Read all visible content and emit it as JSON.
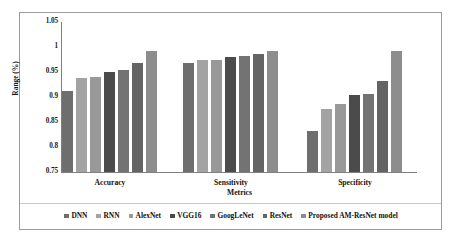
{
  "chart_data": {
    "type": "bar",
    "title": "",
    "xlabel": "Metrics",
    "ylabel": "Range (%)",
    "categories": [
      "Accuracy",
      "Sensitivity",
      "Specificity"
    ],
    "ylim": [
      0.75,
      1.05
    ],
    "yticks": [
      "1.05",
      "1",
      "0.95",
      "0.9",
      "0.85",
      "0.8",
      "0.75"
    ],
    "ytick_values": [
      1.05,
      1.0,
      0.95,
      0.9,
      0.85,
      0.8,
      0.75
    ],
    "grid": false,
    "legend_position": "bottom",
    "series": [
      {
        "name": "DNN",
        "color": "#6e6e6e",
        "values": [
          0.912,
          0.968,
          0.832
        ]
      },
      {
        "name": "RNN",
        "color": "#a3a3a3",
        "values": [
          0.939,
          0.974,
          0.877
        ]
      },
      {
        "name": "AlexNet",
        "color": "#999999",
        "values": [
          0.941,
          0.974,
          0.886
        ]
      },
      {
        "name": "VGG16",
        "color": "#4b4b4b",
        "values": [
          0.951,
          0.981,
          0.904
        ]
      },
      {
        "name": "GoogLeNet",
        "color": "#737373",
        "values": [
          0.955,
          0.982,
          0.907
        ]
      },
      {
        "name": "ResNet",
        "color": "#646464",
        "values": [
          0.968,
          0.987,
          0.932
        ]
      },
      {
        "name": "Proposed AM-ResNet model",
        "color": "#8d8d8d",
        "values": [
          0.993,
          0.992,
          0.993
        ]
      }
    ]
  }
}
